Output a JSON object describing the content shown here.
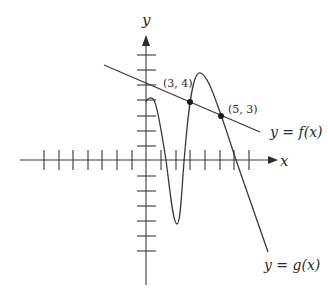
{
  "figure": {
    "axes": {
      "x_label": "x",
      "y_label": "y",
      "x_ticks_left": 7,
      "x_ticks_right": 7,
      "y_ticks_above": 7,
      "y_ticks_below": 6
    },
    "curves": {
      "f_label": "y = f(x)",
      "g_label": "y = g(x)"
    },
    "points": [
      {
        "label": "(3, 4)",
        "x": 3,
        "y": 4
      },
      {
        "label": "(5, 3)",
        "x": 5,
        "y": 3
      }
    ],
    "colors": {
      "ink": "#3a3a3a",
      "background": "#ffffff"
    }
  }
}
